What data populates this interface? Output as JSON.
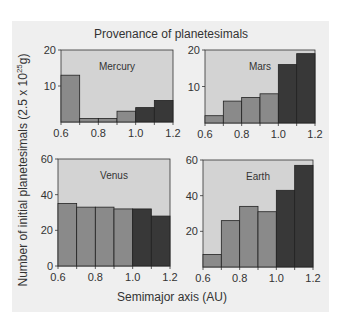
{
  "figure": {
    "title": "Provenance of planetesimals",
    "xlabel": "Semimajor axis (AU)",
    "ylabel_main": "Number of initial planetesimals (2.5 x 10",
    "ylabel_exp": "25",
    "ylabel_unit": "g)",
    "colors": {
      "figure_bg": "#efefef",
      "plot_bg": "#d3d3d3",
      "bar_mid": "#8a8a8a",
      "bar_dark": "#383838",
      "frame": "#333333"
    }
  },
  "chart_data": [
    {
      "type": "bar",
      "title": "Mercury",
      "bin_edges": [
        0.6,
        0.7,
        0.8,
        0.9,
        1.0,
        1.1,
        1.2
      ],
      "categories": [
        "0.6-0.7",
        "0.7-0.8",
        "0.8-0.9",
        "0.9-1.0",
        "1.0-1.1",
        "1.1-1.2"
      ],
      "values": [
        13,
        1,
        1,
        3,
        4,
        6
      ],
      "bar_shade": [
        "mid",
        "mid",
        "mid",
        "mid",
        "dark",
        "dark"
      ],
      "xticks": [
        "0.6",
        "0.8",
        "1.0",
        "1.2"
      ],
      "yticks": [
        "10",
        "20"
      ],
      "ylim": [
        0,
        20
      ],
      "xlabel": "Semimajor axis (AU)",
      "ylabel": "Number of initial planetesimals (2.5 x 10^25 g)"
    },
    {
      "type": "bar",
      "title": "Mars",
      "bin_edges": [
        0.6,
        0.7,
        0.8,
        0.9,
        1.0,
        1.1,
        1.2
      ],
      "categories": [
        "0.6-0.7",
        "0.7-0.8",
        "0.8-0.9",
        "0.9-1.0",
        "1.0-1.1",
        "1.1-1.2"
      ],
      "values": [
        2,
        6,
        7,
        8,
        16,
        19
      ],
      "bar_shade": [
        "mid",
        "mid",
        "mid",
        "mid",
        "dark",
        "dark"
      ],
      "xticks": [
        "0.6",
        "0.8",
        "1.0",
        "1.2"
      ],
      "yticks": [
        "10",
        "20"
      ],
      "ylim": [
        0,
        20
      ],
      "xlabel": "Semimajor axis (AU)",
      "ylabel": "Number of initial planetesimals (2.5 x 10^25 g)"
    },
    {
      "type": "bar",
      "title": "Venus",
      "bin_edges": [
        0.6,
        0.7,
        0.8,
        0.9,
        1.0,
        1.1,
        1.2
      ],
      "categories": [
        "0.6-0.7",
        "0.7-0.8",
        "0.8-0.9",
        "0.9-1.0",
        "1.0-1.1",
        "1.1-1.2"
      ],
      "values": [
        35,
        33,
        33,
        32,
        32,
        28
      ],
      "bar_shade": [
        "mid",
        "mid",
        "mid",
        "mid",
        "dark",
        "dark"
      ],
      "xticks": [
        "0.6",
        "0.8",
        "1.0",
        "1.2"
      ],
      "yticks": [
        "0",
        "20",
        "40",
        "60"
      ],
      "ylim": [
        0,
        60
      ],
      "xlabel": "Semimajor axis (AU)",
      "ylabel": "Number of initial planetesimals (2.5 x 10^25 g)"
    },
    {
      "type": "bar",
      "title": "Earth",
      "bin_edges": [
        0.6,
        0.7,
        0.8,
        0.9,
        1.0,
        1.1,
        1.2
      ],
      "categories": [
        "0.6-0.7",
        "0.7-0.8",
        "0.8-0.9",
        "0.9-1.0",
        "1.0-1.1",
        "1.1-1.2"
      ],
      "values": [
        7,
        26,
        34,
        31,
        43,
        57
      ],
      "bar_shade": [
        "mid",
        "mid",
        "mid",
        "mid",
        "dark",
        "dark"
      ],
      "xticks": [
        "0.6",
        "0.8",
        "1.0",
        "1.2"
      ],
      "yticks": [
        "20",
        "40",
        "60"
      ],
      "ylim": [
        0,
        60
      ],
      "xlabel": "Semimajor axis (AU)",
      "ylabel": "Number of initial planetesimals (2.5 x 10^25 g)"
    }
  ]
}
